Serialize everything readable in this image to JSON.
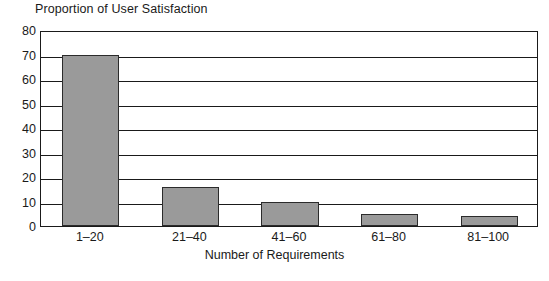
{
  "chart_data": {
    "type": "bar",
    "title": "Proportion of User Satisfaction",
    "xlabel": "Number of Requirements",
    "ylabel": "",
    "categories": [
      "1–20",
      "21–40",
      "41–60",
      "61–80",
      "81–100"
    ],
    "values": [
      70,
      16,
      10,
      5,
      4
    ],
    "ylim": [
      0,
      80
    ],
    "yticks": [
      0,
      10,
      20,
      30,
      40,
      50,
      60,
      70,
      80
    ],
    "ytick_labels": [
      "0",
      "10",
      "20",
      "30",
      "40",
      "50",
      "60",
      "70",
      "80"
    ],
    "grid": "horizontal",
    "legend": "none",
    "bar_fill_color": "#9a9a9a",
    "bar_edge_color": "#2b2b2b",
    "axis_color": "#1a1a1a",
    "background_color": "#ffffff"
  }
}
